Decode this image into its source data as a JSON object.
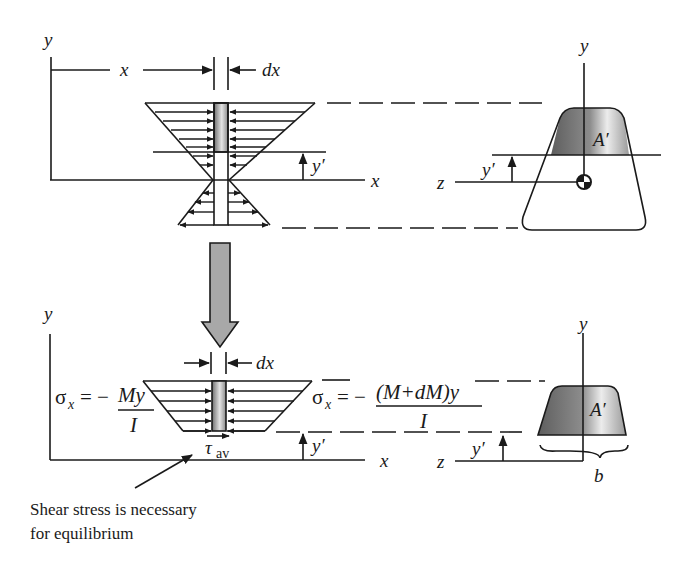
{
  "figure": {
    "type": "engineering-diagram",
    "top_panel": {
      "labels": {
        "y_axis": "y",
        "x_dimension": "x",
        "dx": "dx",
        "y_prime": "y′",
        "x_axis": "x"
      },
      "cross_section": {
        "y_axis": "y",
        "z_axis": "z",
        "y_prime": "y′",
        "area_label": "A′"
      }
    },
    "transition_arrow": "down-arrow",
    "bottom_panel": {
      "labels": {
        "y_axis": "y",
        "dx": "dx",
        "x_axis": "x",
        "y_prime": "y′",
        "tau": "τ",
        "tau_sub": "av"
      },
      "left_stress": {
        "sigma": "σ",
        "sigma_sub": "x",
        "equals": "= −",
        "numerator": "My",
        "denominator": "I"
      },
      "right_stress": {
        "sigma": "σ",
        "sigma_sub": "x",
        "equals": "= −",
        "numerator": "(M+dM)y",
        "denominator": "I"
      },
      "cross_section": {
        "y_axis": "y",
        "z_axis": "z",
        "y_prime": "y′",
        "area_label": "A′",
        "width_label": "b"
      }
    },
    "caption": {
      "line1": "Shear stress is necessary",
      "line2": "for equilibrium"
    },
    "colors": {
      "ink": "#1a1a1a",
      "shade_dark": "#6e6e6e",
      "shade_light": "#e8e8e8",
      "arrow_fill": "#a8a8a8"
    }
  }
}
